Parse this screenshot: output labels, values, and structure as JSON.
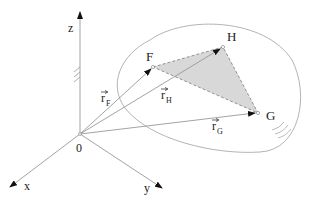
{
  "diagram": {
    "axes": {
      "x": "x",
      "y": "y",
      "z": "z"
    },
    "origin_label": "0",
    "points": {
      "F": "F",
      "G": "G",
      "H": "H"
    },
    "vectors": {
      "rF_base": "r",
      "rF_sub": "F",
      "rH_base": "r",
      "rH_sub": "H",
      "rG_base": "r",
      "rG_sub": "G"
    },
    "colors": {
      "line": "#9a9a9a",
      "triangle_fill": "#d8d8d8",
      "text": "#222222"
    }
  }
}
